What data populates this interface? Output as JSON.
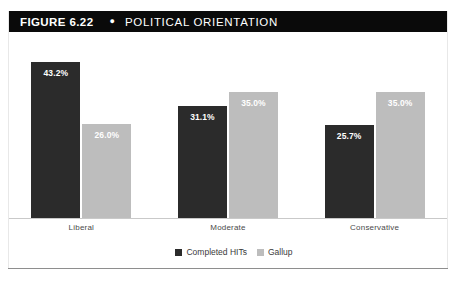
{
  "figure": {
    "label": "FIGURE 6.22",
    "bullet": "●",
    "title": "POLITICAL ORIENTATION"
  },
  "chart_data": {
    "type": "bar",
    "title": "POLITICAL ORIENTATION",
    "xlabel": "",
    "ylabel": "",
    "ylim": [
      0,
      50
    ],
    "grid": false,
    "legend_position": "bottom-center",
    "categories": [
      "Liberal",
      "Moderate",
      "Conservative"
    ],
    "series": [
      {
        "name": "Completed HITs",
        "color": "#2b2b2b",
        "values": [
          43.2,
          31.1,
          25.7
        ],
        "labels": [
          "43.2%",
          "31.1%",
          "25.7%"
        ]
      },
      {
        "name": "Gallup",
        "color": "#bdbdbd",
        "values": [
          26.0,
          35.0,
          35.0
        ],
        "labels": [
          "26.0%",
          "35.0%",
          "35.0%"
        ]
      }
    ]
  },
  "colors": {
    "title_bar_background": "#0a0a0a",
    "title_text": "#ffffff",
    "series_0": "#2b2b2b",
    "series_1": "#bdbdbd",
    "axis_line": "#c9c9c9",
    "frame_line": "#8e8e8e"
  }
}
